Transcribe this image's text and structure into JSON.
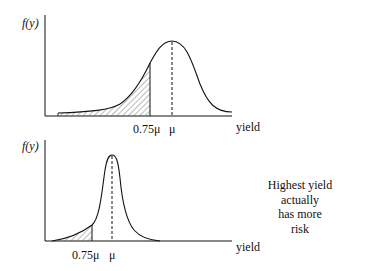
{
  "top_chart": {
    "y_label": "f(y)",
    "x_label": "yield",
    "ticks": [
      {
        "label": "0.75μ"
      },
      {
        "label": "μ"
      }
    ]
  },
  "bottom_chart": {
    "y_label": "f(y)",
    "x_label": "yield",
    "ticks": [
      {
        "label": "0.75μ"
      },
      {
        "label": "μ"
      }
    ]
  },
  "annotation": {
    "lines": [
      "Highest yield",
      "actually",
      "has more",
      "risk"
    ]
  },
  "colors": {
    "ink": "#111111",
    "background": "#ffffff"
  }
}
